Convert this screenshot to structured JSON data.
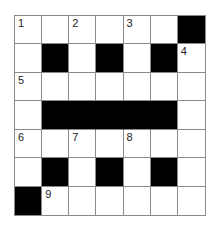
{
  "puzzle": {
    "rows": 7,
    "cols": 7,
    "colors": {
      "black": "#000000",
      "white": "#ffffff",
      "line": "#8a8a8a"
    },
    "grid": [
      [
        "1",
        "",
        "2",
        "",
        "3",
        "",
        "#"
      ],
      [
        "",
        "#",
        "",
        "#",
        "",
        "#",
        "4"
      ],
      [
        "5",
        "",
        "",
        "",
        "",
        "",
        ""
      ],
      [
        "",
        "#",
        "#",
        "#",
        "#",
        "#",
        ""
      ],
      [
        "6",
        "",
        "7",
        "",
        "8",
        "",
        ""
      ],
      [
        "",
        "#",
        "",
        "#",
        "",
        "#",
        ""
      ],
      [
        "#",
        "9",
        "",
        "",
        "",
        "",
        ""
      ]
    ]
  }
}
